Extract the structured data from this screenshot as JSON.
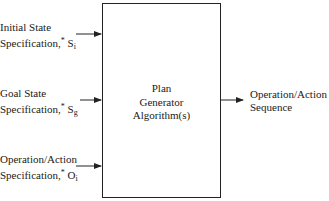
{
  "inputs": [
    {
      "line1": "Initial State",
      "line2": "Specification,",
      "star": "*",
      "symbol": "S",
      "subscript": "i"
    },
    {
      "line1": "Goal State",
      "line2": "Specification,",
      "star": "*",
      "symbol": "S",
      "subscript": "g"
    },
    {
      "line1": "Operation/Action",
      "line2": "Specification,",
      "star": "*",
      "symbol": "O",
      "subscript": "i"
    }
  ],
  "process": {
    "line1": "Plan",
    "line2": "Generator",
    "line3": "Algorithm(s)"
  },
  "output": {
    "line1": "Operation/Action",
    "line2": "Sequence"
  }
}
